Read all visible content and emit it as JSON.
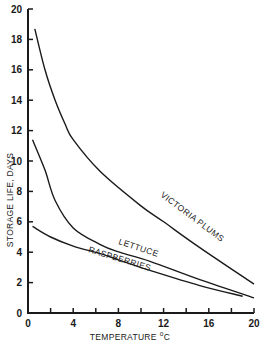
{
  "chart_data": {
    "type": "line",
    "title": "",
    "xlabel": "TEMPERATURE",
    "xlabel_unit_sup": "o",
    "xlabel_unit": "C",
    "ylabel": "STORAGE  LIFE, DAYS",
    "xlim": [
      0,
      20
    ],
    "ylim": [
      0,
      20
    ],
    "x_ticks": [
      0,
      4,
      8,
      12,
      16,
      20
    ],
    "x_minor_ticks": [
      2,
      6,
      10,
      14,
      18
    ],
    "y_ticks": [
      0,
      2,
      4,
      6,
      8,
      10,
      12,
      14,
      16,
      18,
      20
    ],
    "grid": false,
    "legend": "none (curves labeled inline)",
    "series": [
      {
        "name": "VICTORIA PLUMS",
        "x": [
          0.6,
          1.5,
          2.4,
          3.3,
          4.0,
          6.4,
          9.9,
          12.0,
          15.2,
          20.0
        ],
        "y": [
          18.7,
          16.0,
          14.0,
          12.4,
          11.4,
          9.3,
          7.1,
          6.0,
          4.3,
          1.9
        ]
      },
      {
        "name": "LETTUCE",
        "x": [
          0.4,
          1.5,
          2.4,
          4.0,
          6.4,
          8.1,
          10.8,
          15.2,
          20.0
        ],
        "y": [
          11.4,
          9.4,
          7.4,
          5.6,
          4.5,
          4.0,
          3.4,
          2.2,
          1.0
        ]
      },
      {
        "name": "RASPBERRIES",
        "x": [
          0.4,
          2.0,
          4.0,
          6.4,
          8.0,
          10.8,
          15.2,
          19.0
        ],
        "y": [
          5.7,
          5.0,
          4.4,
          3.9,
          3.5,
          2.8,
          1.8,
          1.1
        ]
      }
    ]
  }
}
